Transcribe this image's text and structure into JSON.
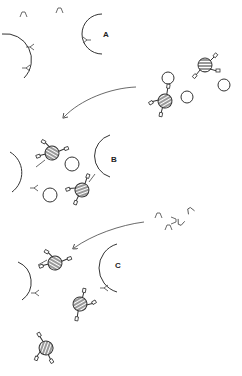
{
  "diagram": {
    "panels": [
      {
        "label": "A",
        "description": "Cells with surface receptors and free ligands"
      },
      {
        "label": "B",
        "description": "Antibody-coated beads binding to cells"
      },
      {
        "label": "C",
        "description": "Free ligands added, beads displaced"
      }
    ],
    "colors": {
      "stroke": "#333333",
      "background": "#ffffff"
    }
  }
}
